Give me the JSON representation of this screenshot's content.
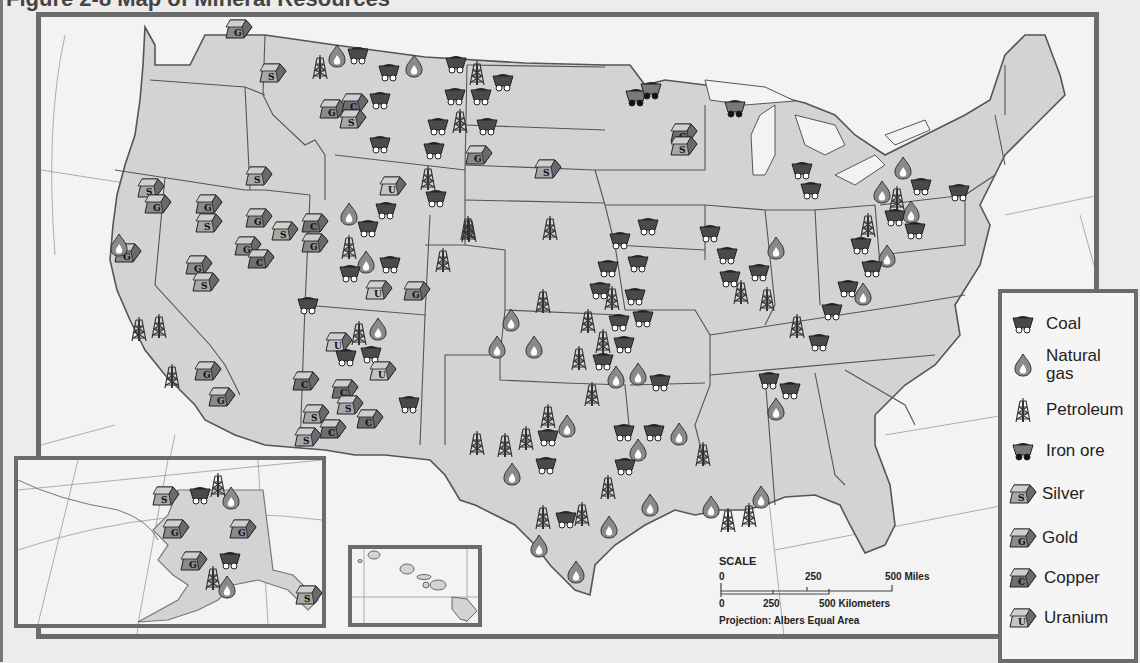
{
  "figure": {
    "title": "Figure 2-8  Map of Mineral Resources"
  },
  "legend": {
    "items": [
      {
        "key": "coal",
        "label": "Coal",
        "icon": "coal-car-icon"
      },
      {
        "key": "natural_gas",
        "label": "Natural gas",
        "label_line1": "Natural",
        "label_line2": "gas",
        "icon": "flame-icon"
      },
      {
        "key": "petroleum",
        "label": "Petroleum",
        "icon": "oil-derrick-icon"
      },
      {
        "key": "iron_ore",
        "label": "Iron ore",
        "icon": "ore-car-icon"
      },
      {
        "key": "silver",
        "label": "Silver",
        "icon": "ingot-s-icon",
        "letter": "S"
      },
      {
        "key": "gold",
        "label": "Gold",
        "icon": "ingot-g-icon",
        "letter": "G"
      },
      {
        "key": "copper",
        "label": "Copper",
        "icon": "ingot-c-icon",
        "letter": "C"
      },
      {
        "key": "uranium",
        "label": "Uranium",
        "icon": "ingot-u-icon",
        "letter": "U"
      }
    ]
  },
  "scale": {
    "heading": "SCALE",
    "miles": {
      "ticks": [
        "0",
        "250",
        "500 Miles"
      ]
    },
    "kilometers": {
      "ticks": [
        "0",
        "250",
        "500 Kilometers"
      ]
    },
    "projection": "Projection: Albers Equal Area"
  },
  "compass": {
    "north_label": "N"
  },
  "insets": {
    "alaska": {
      "symbols": [
        {
          "type": "silver",
          "x": 145,
          "y": 35
        },
        {
          "type": "coal",
          "x": 182,
          "y": 35
        },
        {
          "type": "petroleum",
          "x": 203,
          "y": 22
        },
        {
          "type": "natural_gas",
          "x": 216,
          "y": 36
        },
        {
          "type": "gold",
          "x": 155,
          "y": 68
        },
        {
          "type": "gold",
          "x": 222,
          "y": 68
        },
        {
          "type": "gold",
          "x": 173,
          "y": 100
        },
        {
          "type": "coal",
          "x": 212,
          "y": 100
        },
        {
          "type": "petroleum",
          "x": 198,
          "y": 115
        },
        {
          "type": "natural_gas",
          "x": 212,
          "y": 125
        },
        {
          "type": "silver",
          "x": 288,
          "y": 134
        }
      ]
    },
    "hawaii": {}
  },
  "colors": {
    "land": "#d3d3d3",
    "water": "#f3f3f3",
    "frame": "#6b6b6b",
    "border": "#555555",
    "symbol_dark": "#4a4a4a",
    "symbol_mid": "#8a8a8a",
    "symbol_light": "#bdbdbd"
  },
  "symbols": [
    {
      "type": "gold",
      "x": 236,
      "y": 28
    },
    {
      "type": "silver",
      "x": 270,
      "y": 72
    },
    {
      "type": "petroleum",
      "x": 323,
      "y": 64
    },
    {
      "type": "natural_gas",
      "x": 340,
      "y": 54
    },
    {
      "type": "coal",
      "x": 358,
      "y": 55
    },
    {
      "type": "coal",
      "x": 389,
      "y": 72
    },
    {
      "type": "natural_gas",
      "x": 417,
      "y": 64
    },
    {
      "type": "coal",
      "x": 456,
      "y": 64
    },
    {
      "type": "petroleum",
      "x": 480,
      "y": 70
    },
    {
      "type": "coal",
      "x": 503,
      "y": 82
    },
    {
      "type": "coal",
      "x": 455,
      "y": 96
    },
    {
      "type": "coal",
      "x": 481,
      "y": 96
    },
    {
      "type": "coal",
      "x": 380,
      "y": 100
    },
    {
      "type": "gold",
      "x": 330,
      "y": 108
    },
    {
      "type": "copper",
      "x": 352,
      "y": 102
    },
    {
      "type": "silver",
      "x": 350,
      "y": 118
    },
    {
      "type": "coal",
      "x": 438,
      "y": 126
    },
    {
      "type": "petroleum",
      "x": 463,
      "y": 118
    },
    {
      "type": "coal",
      "x": 487,
      "y": 126
    },
    {
      "type": "coal",
      "x": 380,
      "y": 144
    },
    {
      "type": "coal",
      "x": 434,
      "y": 150
    },
    {
      "type": "gold",
      "x": 476,
      "y": 154
    },
    {
      "type": "silver",
      "x": 545,
      "y": 168
    },
    {
      "type": "petroleum",
      "x": 431,
      "y": 175
    },
    {
      "type": "uranium",
      "x": 390,
      "y": 185
    },
    {
      "type": "coal",
      "x": 436,
      "y": 198
    },
    {
      "type": "silver",
      "x": 148,
      "y": 187
    },
    {
      "type": "gold",
      "x": 155,
      "y": 203
    },
    {
      "type": "silver",
      "x": 256,
      "y": 175
    },
    {
      "type": "gold",
      "x": 206,
      "y": 203
    },
    {
      "type": "silver",
      "x": 206,
      "y": 222
    },
    {
      "type": "gold",
      "x": 256,
      "y": 217
    },
    {
      "type": "natural_gas",
      "x": 352,
      "y": 212
    },
    {
      "type": "coal",
      "x": 386,
      "y": 210
    },
    {
      "type": "petroleum",
      "x": 471,
      "y": 225
    },
    {
      "type": "petroleum",
      "x": 553,
      "y": 225
    },
    {
      "type": "silver",
      "x": 282,
      "y": 230
    },
    {
      "type": "copper",
      "x": 312,
      "y": 222
    },
    {
      "type": "gold",
      "x": 312,
      "y": 242
    },
    {
      "type": "gold",
      "x": 125,
      "y": 252
    },
    {
      "type": "natural_gas",
      "x": 122,
      "y": 243
    },
    {
      "type": "gold",
      "x": 245,
      "y": 245
    },
    {
      "type": "copper",
      "x": 258,
      "y": 258
    },
    {
      "type": "gold",
      "x": 196,
      "y": 264
    },
    {
      "type": "silver",
      "x": 203,
      "y": 281
    },
    {
      "type": "coal",
      "x": 368,
      "y": 228
    },
    {
      "type": "petroleum",
      "x": 352,
      "y": 244
    },
    {
      "type": "natural_gas",
      "x": 369,
      "y": 260
    },
    {
      "type": "coal",
      "x": 390,
      "y": 264
    },
    {
      "type": "coal",
      "x": 350,
      "y": 273
    },
    {
      "type": "petroleum",
      "x": 446,
      "y": 257
    },
    {
      "type": "uranium",
      "x": 376,
      "y": 289
    },
    {
      "type": "gold",
      "x": 414,
      "y": 290
    },
    {
      "type": "coal",
      "x": 308,
      "y": 305
    },
    {
      "type": "petroleum",
      "x": 142,
      "y": 326
    },
    {
      "type": "petroleum",
      "x": 162,
      "y": 323
    },
    {
      "type": "petroleum",
      "x": 175,
      "y": 373
    },
    {
      "type": "petroleum",
      "x": 362,
      "y": 330
    },
    {
      "type": "natural_gas",
      "x": 381,
      "y": 327
    },
    {
      "type": "uranium",
      "x": 336,
      "y": 341
    },
    {
      "type": "coal",
      "x": 346,
      "y": 357
    },
    {
      "type": "coal",
      "x": 371,
      "y": 354
    },
    {
      "type": "uranium",
      "x": 380,
      "y": 370
    },
    {
      "type": "gold",
      "x": 205,
      "y": 370
    },
    {
      "type": "gold",
      "x": 219,
      "y": 396
    },
    {
      "type": "copper",
      "x": 303,
      "y": 380
    },
    {
      "type": "copper",
      "x": 342,
      "y": 388
    },
    {
      "type": "silver",
      "x": 347,
      "y": 404
    },
    {
      "type": "copper",
      "x": 367,
      "y": 418
    },
    {
      "type": "silver",
      "x": 313,
      "y": 413
    },
    {
      "type": "copper",
      "x": 330,
      "y": 428
    },
    {
      "type": "silver",
      "x": 305,
      "y": 436
    },
    {
      "type": "coal",
      "x": 409,
      "y": 404
    },
    {
      "type": "petroleum",
      "x": 472,
      "y": 227
    },
    {
      "type": "coal",
      "x": 620,
      "y": 240
    },
    {
      "type": "coal",
      "x": 648,
      "y": 226
    },
    {
      "type": "coal",
      "x": 608,
      "y": 268
    },
    {
      "type": "coal",
      "x": 638,
      "y": 263
    },
    {
      "type": "petroleum",
      "x": 546,
      "y": 298
    },
    {
      "type": "natural_gas",
      "x": 514,
      "y": 318
    },
    {
      "type": "coal",
      "x": 600,
      "y": 290
    },
    {
      "type": "petroleum",
      "x": 615,
      "y": 295
    },
    {
      "type": "coal",
      "x": 635,
      "y": 296
    },
    {
      "type": "petroleum",
      "x": 591,
      "y": 318
    },
    {
      "type": "coal",
      "x": 619,
      "y": 322
    },
    {
      "type": "coal",
      "x": 643,
      "y": 318
    },
    {
      "type": "petroleum",
      "x": 606,
      "y": 338
    },
    {
      "type": "natural_gas",
      "x": 500,
      "y": 345
    },
    {
      "type": "natural_gas",
      "x": 537,
      "y": 345
    },
    {
      "type": "coal",
      "x": 624,
      "y": 344
    },
    {
      "type": "petroleum",
      "x": 582,
      "y": 355
    },
    {
      "type": "coal",
      "x": 603,
      "y": 361
    },
    {
      "type": "natural_gas",
      "x": 619,
      "y": 375
    },
    {
      "type": "natural_gas",
      "x": 641,
      "y": 372
    },
    {
      "type": "coal",
      "x": 660,
      "y": 382
    },
    {
      "type": "petroleum",
      "x": 595,
      "y": 391
    },
    {
      "type": "petroleum",
      "x": 551,
      "y": 413
    },
    {
      "type": "natural_gas",
      "x": 570,
      "y": 424
    },
    {
      "type": "coal",
      "x": 548,
      "y": 437
    },
    {
      "type": "petroleum",
      "x": 480,
      "y": 440
    },
    {
      "type": "petroleum",
      "x": 508,
      "y": 442
    },
    {
      "type": "petroleum",
      "x": 529,
      "y": 435
    },
    {
      "type": "coal",
      "x": 546,
      "y": 465
    },
    {
      "type": "natural_gas",
      "x": 515,
      "y": 472
    },
    {
      "type": "coal",
      "x": 624,
      "y": 432
    },
    {
      "type": "coal",
      "x": 654,
      "y": 432
    },
    {
      "type": "natural_gas",
      "x": 682,
      "y": 432
    },
    {
      "type": "natural_gas",
      "x": 641,
      "y": 448
    },
    {
      "type": "coal",
      "x": 625,
      "y": 466
    },
    {
      "type": "petroleum",
      "x": 611,
      "y": 484
    },
    {
      "type": "natural_gas",
      "x": 653,
      "y": 503
    },
    {
      "type": "petroleum",
      "x": 546,
      "y": 514
    },
    {
      "type": "coal",
      "x": 566,
      "y": 519
    },
    {
      "type": "petroleum",
      "x": 585,
      "y": 511
    },
    {
      "type": "natural_gas",
      "x": 612,
      "y": 525
    },
    {
      "type": "natural_gas",
      "x": 542,
      "y": 544
    },
    {
      "type": "natural_gas",
      "x": 579,
      "y": 570
    },
    {
      "type": "petroleum",
      "x": 706,
      "y": 451
    },
    {
      "type": "natural_gas",
      "x": 714,
      "y": 505
    },
    {
      "type": "petroleum",
      "x": 731,
      "y": 517
    },
    {
      "type": "petroleum",
      "x": 752,
      "y": 512
    },
    {
      "type": "natural_gas",
      "x": 764,
      "y": 495
    },
    {
      "type": "iron_ore",
      "x": 636,
      "y": 97
    },
    {
      "type": "iron_ore",
      "x": 651,
      "y": 90
    },
    {
      "type": "iron_ore",
      "x": 735,
      "y": 108
    },
    {
      "type": "copper",
      "x": 681,
      "y": 132
    },
    {
      "type": "silver",
      "x": 681,
      "y": 145
    },
    {
      "type": "coal",
      "x": 802,
      "y": 170
    },
    {
      "type": "coal",
      "x": 811,
      "y": 190
    },
    {
      "type": "natural_gas",
      "x": 906,
      "y": 166
    },
    {
      "type": "natural_gas",
      "x": 885,
      "y": 190
    },
    {
      "type": "petroleum",
      "x": 900,
      "y": 195
    },
    {
      "type": "coal",
      "x": 921,
      "y": 186
    },
    {
      "type": "natural_gas",
      "x": 914,
      "y": 210
    },
    {
      "type": "coal",
      "x": 959,
      "y": 192
    },
    {
      "type": "coal",
      "x": 895,
      "y": 217
    },
    {
      "type": "coal",
      "x": 915,
      "y": 230
    },
    {
      "type": "petroleum",
      "x": 871,
      "y": 222
    },
    {
      "type": "natural_gas",
      "x": 779,
      "y": 246
    },
    {
      "type": "coal",
      "x": 710,
      "y": 233
    },
    {
      "type": "coal",
      "x": 727,
      "y": 255
    },
    {
      "type": "coal",
      "x": 730,
      "y": 278
    },
    {
      "type": "coal",
      "x": 759,
      "y": 272
    },
    {
      "type": "petroleum",
      "x": 744,
      "y": 289
    },
    {
      "type": "petroleum",
      "x": 770,
      "y": 296
    },
    {
      "type": "coal",
      "x": 861,
      "y": 245
    },
    {
      "type": "natural_gas",
      "x": 890,
      "y": 254
    },
    {
      "type": "coal",
      "x": 872,
      "y": 268
    },
    {
      "type": "coal",
      "x": 848,
      "y": 288
    },
    {
      "type": "natural_gas",
      "x": 866,
      "y": 292
    },
    {
      "type": "coal",
      "x": 832,
      "y": 311
    },
    {
      "type": "petroleum",
      "x": 800,
      "y": 323
    },
    {
      "type": "coal",
      "x": 819,
      "y": 342
    },
    {
      "type": "coal",
      "x": 769,
      "y": 380
    },
    {
      "type": "coal",
      "x": 790,
      "y": 390
    },
    {
      "type": "natural_gas",
      "x": 779,
      "y": 407
    }
  ]
}
